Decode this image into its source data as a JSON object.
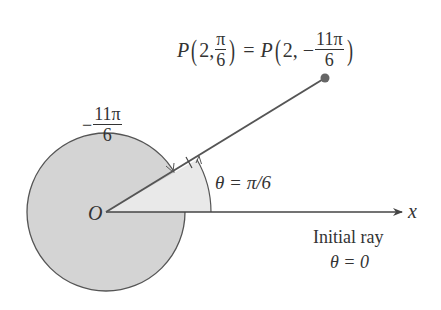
{
  "diagram": {
    "type": "polar-angle-diagram",
    "colors": {
      "circle_fill": "#d4d4d4",
      "sector_fill": "#e8e8e8",
      "stroke": "#555555",
      "point": "#666666",
      "text": "#333333"
    },
    "point_label": {
      "lhs_name": "P",
      "lhs_r": "2,",
      "lhs_theta_num": "π",
      "lhs_theta_den": "6",
      "equals": "=",
      "rhs_name": "P",
      "rhs_r": "2, −",
      "rhs_theta_num": "11π",
      "rhs_theta_den": "6"
    },
    "negative_angle_label": {
      "sign": "−",
      "num": "11π",
      "den": "6"
    },
    "origin_label": "O",
    "angle_label": "θ = π/6",
    "axis_label": "x",
    "initial_ray_label": "Initial ray",
    "initial_ray_angle": "θ = 0",
    "geometry": {
      "origin": [
        106,
        212
      ],
      "circle_radius": 79,
      "sector_radius": 105,
      "angle_degrees": 30,
      "point": [
        325,
        78
      ]
    }
  }
}
